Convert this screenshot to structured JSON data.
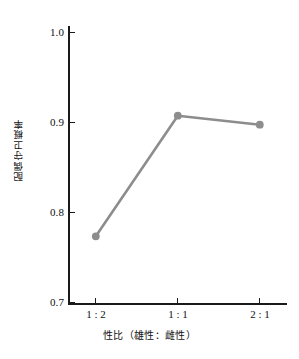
{
  "chart_data": {
    "type": "line",
    "title": "",
    "subtitle": "",
    "xlabel": "性比（雄性：雌性）",
    "ylabel": "配偶守卫概率",
    "categories": [
      "1 : 2",
      "1 : 1",
      "2 : 1"
    ],
    "values": [
      0.773,
      0.907,
      0.897
    ],
    "series": [
      {
        "name": "配偶守卫概率",
        "values": [
          0.773,
          0.907,
          0.897
        ]
      }
    ],
    "ylim": [
      0.7,
      1.0
    ],
    "ytick_labels": [
      "1.0",
      "0.9",
      "0.8",
      "0.7"
    ],
    "ytick_values": [
      1.0,
      0.9,
      0.8,
      0.7
    ],
    "xtick_labels": [
      "1 : 2",
      "1 : 1",
      "2 : 1"
    ],
    "grid": false,
    "legend": false,
    "legend_position": "none",
    "line_color": "#8d8d8d",
    "marker_color": "#8d8d8d",
    "axis_color": "#1a1a1a",
    "background_color": "#ffffff",
    "marker": "circle"
  },
  "axes": {
    "y_title": "配偶守卫概率",
    "x_title": "性比（雄性：雌性）",
    "y_ticks": [
      {
        "label": "1.0",
        "value": 1.0
      },
      {
        "label": "0.9",
        "value": 0.9
      },
      {
        "label": "0.8",
        "value": 0.8
      },
      {
        "label": "0.7",
        "value": 0.7
      }
    ],
    "x_ticks": [
      {
        "label": "1 : 2",
        "value": 0
      },
      {
        "label": "1 : 1",
        "value": 1
      },
      {
        "label": "2 : 1",
        "value": 2
      }
    ]
  }
}
